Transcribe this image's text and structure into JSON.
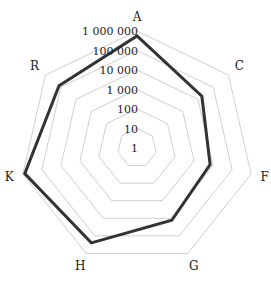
{
  "chart_data": {
    "type": "radar",
    "title": "",
    "scale": "log10",
    "categories": [
      "A",
      "C",
      "F",
      "G",
      "H",
      "K",
      "R"
    ],
    "series": [
      {
        "name": "series1",
        "values": [
          560000,
          18000,
          7000,
          13000,
          250000,
          800000,
          130000
        ],
        "color": "#333333"
      }
    ],
    "ticks": [
      "1",
      "10",
      "100",
      "1 000",
      "10 000",
      "100 000",
      "1 000 000"
    ],
    "tick_values": [
      1,
      10,
      100,
      1000,
      10000,
      100000,
      1000000
    ],
    "range": [
      1,
      1000000
    ],
    "grid": true,
    "legend": "none",
    "colors": {
      "grid": "#cfcfcf",
      "series": "#333333",
      "text": "#222222"
    }
  }
}
